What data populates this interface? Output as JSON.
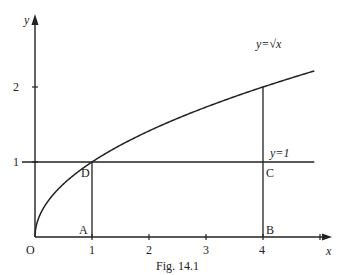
{
  "figure": {
    "caption": "Fig. 14.1",
    "axes": {
      "x_label": "x",
      "y_label": "y",
      "origin_label": "O",
      "x_ticks": [
        "1",
        "2",
        "3",
        "4"
      ],
      "y_ticks": [
        "1",
        "2"
      ]
    },
    "curve": {
      "label": "y=√x",
      "function": "sqrt",
      "x_range": [
        0,
        4.9
      ]
    },
    "line": {
      "label": "y=1",
      "y": 1
    },
    "points": [
      {
        "name": "A",
        "x": 1,
        "y": 0
      },
      {
        "name": "B",
        "x": 4,
        "y": 0
      },
      {
        "name": "C",
        "x": 4,
        "y": 1
      },
      {
        "name": "D",
        "x": 1,
        "y": 1
      }
    ],
    "verticals": [
      {
        "x": 1,
        "from": 0,
        "to": 1
      },
      {
        "x": 4,
        "from": 0,
        "to": 2
      }
    ]
  }
}
